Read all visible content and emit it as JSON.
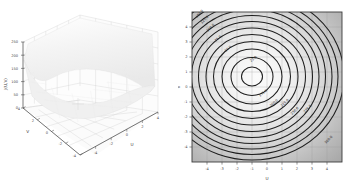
{
  "figure": {
    "panel_count": 2,
    "background_color": "#ffffff"
  },
  "surface_plot": {
    "name": "3d-surface-plot",
    "type": "surface",
    "xlabel": "U",
    "ylabel": "V",
    "zlabel": "J(U,V)",
    "x_ticks": [
      "-4",
      "-2",
      "0",
      "2",
      "4"
    ],
    "y_ticks": [
      "-4",
      "-2",
      "0",
      "2",
      "4"
    ],
    "z_ticks": [
      "0",
      "50",
      "100",
      "150",
      "200",
      "250"
    ],
    "zlim": [
      0,
      250
    ],
    "xlim": [
      -5,
      5
    ],
    "ylim": [
      -5,
      5
    ],
    "grid": true,
    "pane_color": "#fcfcfc",
    "grid_color": "#c8c8c8",
    "surface_color": "#f2f2f2",
    "surface_edge_color": "#e2e2e2",
    "axis_color": "#4d4d4d",
    "minimum_marker": "+",
    "minimum_u": -1.0,
    "minimum_v": 0.7
  },
  "contour_plot": {
    "name": "contour-plot",
    "type": "contour",
    "xlabel": "U",
    "ylabel": "V",
    "x_ticks": [
      "-4",
      "-3",
      "-2",
      "-1",
      "0",
      "1",
      "2",
      "3",
      "4"
    ],
    "y_ticks": [
      "-4",
      "-3",
      "-2",
      "-1",
      "0",
      "1",
      "2",
      "3",
      "4"
    ],
    "xlim": [
      -5,
      5
    ],
    "ylim": [
      -5,
      5
    ],
    "grid": true,
    "grid_color": "#9a9a9a",
    "frame_color": "#3c3c3c",
    "fill_low_color": "#f7f7f7",
    "fill_high_color": "#a8a8a8",
    "contour_color": "#1e1e1e",
    "center_u": -1.0,
    "center_v": 0.7,
    "levels": [
      25,
      50,
      75,
      100,
      125,
      150,
      175,
      200,
      225,
      250
    ],
    "level_labels": [
      {
        "text": "25.0",
        "u": -0.05,
        "v": 1.35
      },
      {
        "text": "50.0",
        "u": -1.95,
        "v": 2.0
      },
      {
        "text": "75.0",
        "u": -2.65,
        "v": 2.75
      },
      {
        "text": "100.0",
        "u": -3.2,
        "v": 3.4
      },
      {
        "text": "125.0",
        "u": -3.6,
        "v": 3.95
      },
      {
        "text": "150.0",
        "u": -3.95,
        "v": 4.35
      },
      {
        "text": "175.0",
        "u": 0.55,
        "v": -1.35
      },
      {
        "text": "200.0",
        "u": 1.25,
        "v": -2.0
      },
      {
        "text": "225.0",
        "u": 1.95,
        "v": -1.95
      },
      {
        "text": "250.0",
        "u": 2.6,
        "v": -2.45
      },
      {
        "text": "275.0",
        "u": 3.45,
        "v": -2.3
      },
      {
        "text": "300.0",
        "u": 4.35,
        "v": -4.35
      }
    ]
  }
}
